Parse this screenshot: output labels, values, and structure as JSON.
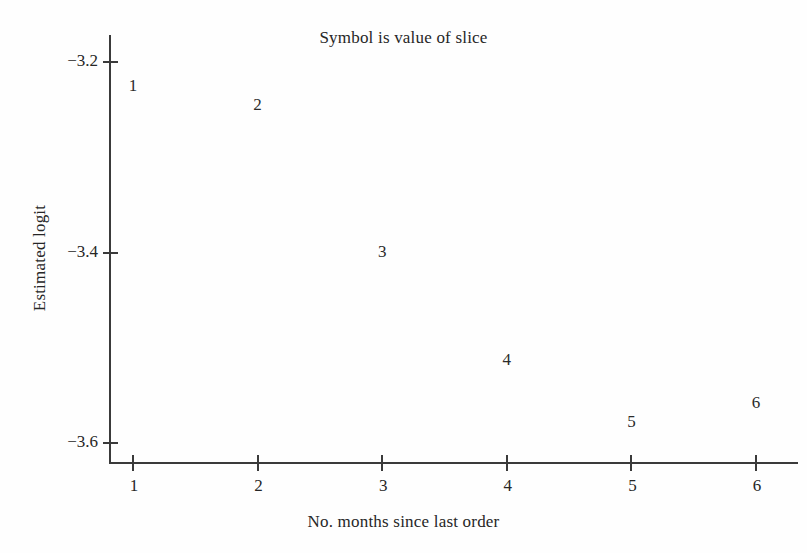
{
  "chart_data": {
    "type": "scatter",
    "title": "Symbol is value of slice",
    "xlabel": "No. months since last order",
    "ylabel": "Estimated logit",
    "xlim": [
      0.85,
      6.4
    ],
    "ylim": [
      -3.63,
      -3.17
    ],
    "xticks": [
      1,
      2,
      3,
      4,
      5,
      6
    ],
    "xtick_labels": [
      "1",
      "2",
      "3",
      "4",
      "5",
      "6"
    ],
    "yticks": [
      -3.2,
      -3.4,
      -3.6
    ],
    "ytick_labels": [
      "−3.2",
      "−3.4",
      "−3.6"
    ],
    "grid": false,
    "legend": false,
    "marker_style": "digit-label",
    "x": [
      1,
      2,
      3,
      4,
      5,
      6
    ],
    "values": [
      -3.228,
      -3.248,
      -3.403,
      -3.516,
      -3.581,
      -3.561
    ],
    "point_labels": [
      "1",
      "2",
      "3",
      "4",
      "5",
      "6"
    ],
    "points": [
      {
        "label": "1",
        "x": 1,
        "y": -3.228
      },
      {
        "label": "2",
        "x": 2,
        "y": -3.248
      },
      {
        "label": "3",
        "x": 3,
        "y": -3.403
      },
      {
        "label": "4",
        "x": 4,
        "y": -3.516
      },
      {
        "label": "5",
        "x": 5,
        "y": -3.581
      },
      {
        "label": "6",
        "x": 6,
        "y": -3.561
      }
    ]
  },
  "colors": {
    "ink": "#2b2b2b",
    "axis": "#3a3a3a",
    "background": "#fefefe"
  }
}
